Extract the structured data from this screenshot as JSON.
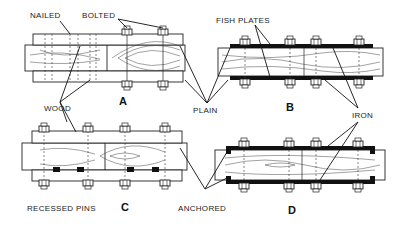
{
  "diagram": {
    "type": "technical-illustration",
    "panels": [
      {
        "id": "A",
        "letter": "A",
        "description": "Wood side plates, nailed and bolted, plain"
      },
      {
        "id": "B",
        "letter": "B",
        "description": "Iron fish plates bolted, plain"
      },
      {
        "id": "C",
        "letter": "C",
        "description": "Wood side plates with recessed pins, bolted"
      },
      {
        "id": "D",
        "letter": "D",
        "description": "Iron fish plates, anchored ends, bolted"
      }
    ],
    "labels": {
      "nailed": "NAILED",
      "bolted": "BOLTED",
      "fish_plates": "FISH PLATES",
      "wood": "WOOD",
      "plain": "PLAIN",
      "iron": "IRON",
      "recessed_pins": "RECESSED PINS",
      "anchored": "ANCHORED"
    },
    "colors": {
      "ink": "#1a1a1a",
      "background": "#ffffff",
      "iron_plate": "#111111"
    }
  }
}
